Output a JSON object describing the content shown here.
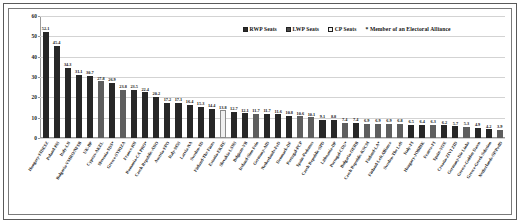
{
  "legend": {
    "items": [
      {
        "label": "RWP Seats",
        "swatch": "rwp",
        "color": "#272727"
      },
      {
        "label": "LWP Seats",
        "swatch": "lwp",
        "color": "#5e5e5e"
      },
      {
        "label": "CP Seats",
        "swatch": "cp",
        "color": "#efefef"
      }
    ],
    "note": "* Member of an Electoral Alliance"
  },
  "chart_data": {
    "type": "bar",
    "title": "",
    "subtitle": "",
    "xlabel": "",
    "ylabel": "",
    "ylim": [
      0,
      60
    ],
    "yticks": [
      0,
      10,
      20,
      30,
      40,
      50,
      60
    ],
    "grid": true,
    "legend_position": "top-right",
    "annotations": [
      "* Member of an Electoral Alliance"
    ],
    "categories": [
      "Hungary-FIDESZ",
      "Poland-PiS",
      "Italy-LN",
      "Bulgaria-VMRO/NFSB",
      "UK-BP",
      "Cyprus-AKEL",
      "Slovenia-SDS*",
      "Greece-SYRIZA",
      "France-RN",
      "Romania-CA PRO*",
      "Czech Republic-ANO",
      "Austria-FPO",
      "Italy-M5S",
      "Latvia-NA",
      "Sweden-SD",
      "Finland-The Finns",
      "Estonia-EKRE",
      "Slovakia-LSNS",
      "Belgium-VB",
      "Ireland-Sinn Fein",
      "Germany-AfD",
      "Netherlands-FvD",
      "Denmark-DF",
      "Portugal-PCP",
      "Spain-Podemos",
      "Czech Republic-SPD",
      "Lithuania-DP",
      "Portugal-CDU*",
      "Bulgaria-OERB",
      "Czech Republic-KSCM",
      "Finland-LA*",
      "Finland-Left Alliance",
      "Sweden-The Left",
      "Italy-FI",
      "Hungary-JOBBIK",
      "France-FI",
      "Spain-VOX",
      "Croatia-ZIVI ZID",
      "Germany-Die Linke",
      "Greece-Golden Dawn",
      "Greece-Greek Solution",
      "Netherlands-SP/PvdD"
    ],
    "values": [
      52.1,
      45.4,
      34.3,
      31.1,
      30.7,
      27.8,
      26.9,
      23.8,
      23.5,
      22.4,
      20.2,
      17.2,
      17.1,
      16.4,
      15.3,
      14.4,
      13.8,
      12.7,
      12.1,
      11.7,
      11.7,
      11.6,
      10.8,
      10.6,
      10.1,
      9.1,
      8.8,
      7.4,
      7.4,
      6.9,
      6.9,
      6.9,
      6.8,
      6.5,
      6.4,
      6.3,
      6.2,
      5.7,
      5.3,
      4.9,
      4.2,
      3.9
    ],
    "series_of": [
      "rwp",
      "rwp",
      "rwp",
      "rwp",
      "rwp",
      "lwp",
      "rwp",
      "lwp",
      "rwp",
      "rwp",
      "rwp",
      "rwp",
      "rwp",
      "rwp",
      "rwp",
      "rwp",
      "cp",
      "rwp",
      "rwp",
      "lwp",
      "rwp",
      "rwp",
      "rwp",
      "lwp",
      "lwp",
      "rwp",
      "rwp",
      "lwp",
      "rwp",
      "lwp",
      "lwp",
      "lwp",
      "lwp",
      "rwp",
      "rwp",
      "lwp",
      "rwp",
      "rwp",
      "lwp",
      "rwp",
      "rwp",
      "lwp"
    ]
  }
}
